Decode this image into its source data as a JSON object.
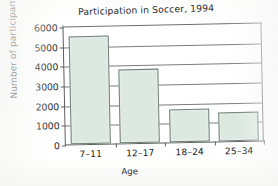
{
  "chart_data": {
    "type": "bar",
    "title": "Participation in Soccer, 1994",
    "xlabel": "Age",
    "ylabel": "Number of participants",
    "categories": [
      "7–11",
      "12–17",
      "18–24",
      "25–34"
    ],
    "values": [
      5500,
      3750,
      1700,
      1500
    ],
    "ylim": [
      0,
      6000
    ],
    "yticks": [
      0,
      1000,
      2000,
      3000,
      4000,
      5000,
      6000
    ],
    "ytick_labels": [
      "0",
      "1000",
      "2000",
      "3000",
      "4000",
      "5000",
      "6000"
    ],
    "grid": "horizontal",
    "legend": "none",
    "bar_fill_color": "#dde8e1",
    "bar_edge_color": "#72807a",
    "axis_color": "#5d5f60",
    "grid_color": "#7a7c7d",
    "background_color": "#ffffff"
  }
}
